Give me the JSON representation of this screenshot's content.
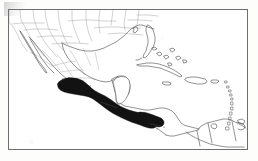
{
  "figure": {
    "kind": "distribution-map",
    "title": "",
    "caption": "",
    "region_described": "Mexico, Central America, Caribbean and northern South America",
    "legend_text": "",
    "frame": {
      "visible": true,
      "stroke_color": "#6e6e6e",
      "stroke_width": 1,
      "x": 8,
      "y": 9,
      "width": 240,
      "height": 141
    },
    "colors": {
      "background": "#ffffff",
      "paper": "#fdfdfc",
      "coastline": "#4d4d4d",
      "political_border": "#8a8a8a",
      "range_fill": "#121212",
      "frame": "#6e6e6e"
    },
    "shaded_range": {
      "label": "species distribution",
      "fill": "#121212",
      "extent": "southern Mexico (Pacific slope) east through Chiapas, Guatemala, Honduras and Nicaragua"
    },
    "landmasses": [
      "United States (Gulf states)",
      "Mexico",
      "Baja California",
      "Yucatan Peninsula",
      "Guatemala",
      "Belize",
      "Honduras",
      "El Salvador",
      "Nicaragua",
      "Costa Rica",
      "Panama",
      "Cuba",
      "Hispaniola",
      "Jamaica",
      "Puerto Rico",
      "Bahamas",
      "Lesser Antilles",
      "Colombia",
      "Venezuela",
      "Trinidad"
    ],
    "artifacts": {
      "corner_smudge": "faint grey scan smudge at upper-left outside frame"
    }
  }
}
